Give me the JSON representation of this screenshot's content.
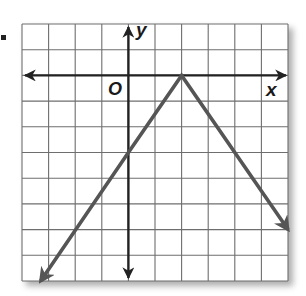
{
  "exercise_marker": ".",
  "chart_data": {
    "type": "line",
    "title": "",
    "xlabel": "x",
    "ylabel": "y",
    "origin_label": "O",
    "grid": true,
    "xlim": [
      -4,
      6
    ],
    "ylim": [
      -8,
      2
    ],
    "grid_step": 1,
    "tick_labels": [],
    "series": [
      {
        "name": "y = -1.5|x - 2|",
        "points": [
          [
            -3.3,
            -8
          ],
          [
            0,
            -3
          ],
          [
            2,
            0
          ],
          [
            6,
            -6
          ]
        ],
        "vertex": [
          2,
          0
        ],
        "y_intercept": -3,
        "arrows_at_ends": true,
        "color": "#555555"
      }
    ]
  },
  "colors": {
    "grid": "#6e6e6e",
    "axes": "#222222",
    "graph_line": "#555555",
    "border_shadow": "#9a9a9a"
  }
}
